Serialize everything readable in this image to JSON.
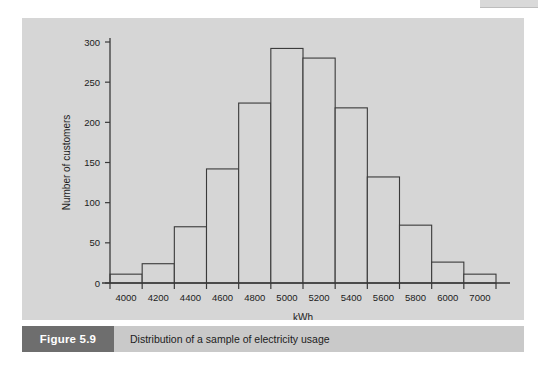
{
  "figure": {
    "caption_tag": "Figure 5.9",
    "caption_text": "Distribution of a sample of electricity usage",
    "panel_bg": "#d6d6d6",
    "caption_bar_bg": "#c9c9c9",
    "caption_tag_bg": "#6e6e6e",
    "axis_color": "#3a3a3a"
  },
  "chart_data": {
    "type": "bar",
    "title": "",
    "subtitle": "",
    "xlabel": "kWh",
    "ylabel": "Number of customers",
    "grid": false,
    "legend": false,
    "legend_position": "none",
    "bar_fill": "#d6d6d6",
    "bar_stroke": "#3a3a3a",
    "ylim": [
      0,
      300
    ],
    "yticks": [
      0,
      50,
      100,
      150,
      200,
      250,
      300
    ],
    "ytick_labels": [
      "0",
      "50",
      "100",
      "150",
      "200",
      "250",
      "300"
    ],
    "xtick_labels": [
      "4000",
      "4200",
      "4400",
      "4600",
      "4800",
      "5000",
      "5200",
      "5400",
      "5600",
      "5800",
      "6000",
      "7000"
    ],
    "bin_edges": [
      3900,
      4100,
      4300,
      4500,
      4700,
      4900,
      5100,
      5300,
      5500,
      5700,
      5900,
      6100,
      6300
    ],
    "bin_centers": [
      4000,
      4200,
      4400,
      4600,
      4800,
      5000,
      5200,
      5400,
      5600,
      5800,
      6000,
      7000
    ],
    "categories": [
      "4000",
      "4200",
      "4400",
      "4600",
      "4800",
      "5000",
      "5200",
      "5400",
      "5600",
      "5800",
      "6000",
      "7000"
    ],
    "values": [
      11,
      24,
      70,
      142,
      224,
      292,
      280,
      218,
      132,
      72,
      26,
      11
    ]
  }
}
